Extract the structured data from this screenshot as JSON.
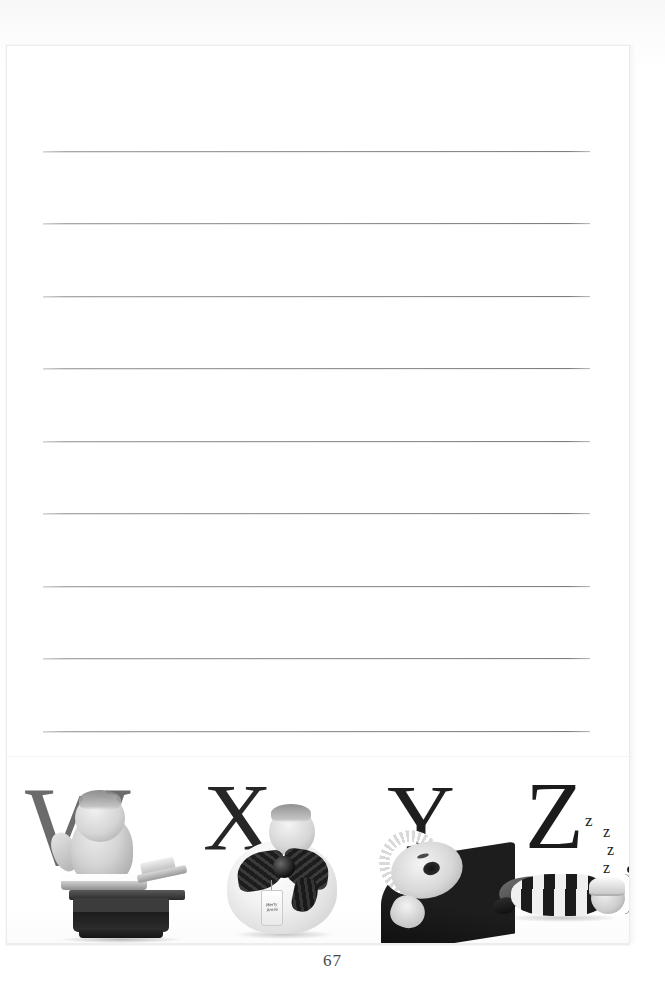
{
  "page": {
    "number": "67",
    "kind": "lined-journal-page",
    "line_count": 9,
    "background_color": "#ffffff",
    "border_color": "#ececec",
    "rule_color": "#8d8d8d"
  },
  "ruled_lines": [
    {
      "index": 1,
      "text": ""
    },
    {
      "index": 2,
      "text": ""
    },
    {
      "index": 3,
      "text": ""
    },
    {
      "index": 4,
      "text": ""
    },
    {
      "index": 5,
      "text": ""
    },
    {
      "index": 6,
      "text": ""
    },
    {
      "index": 7,
      "text": ""
    },
    {
      "index": 8,
      "text": ""
    },
    {
      "index": 9,
      "text": ""
    }
  ],
  "alphabet_strip": {
    "letters": [
      {
        "letter": "W",
        "color": "#6b6b6b",
        "photo_caption": "baby sitting on an old balance scale",
        "icon": "baby-on-scale-photo"
      },
      {
        "letter": "X",
        "color": "#262626",
        "photo_caption": "baby wrapped as a gift with a plaid bow and gift tag",
        "icon": "baby-gift-photo",
        "tag_text": "Merry Xmas"
      },
      {
        "letter": "Y",
        "color": "#1f1f1f",
        "photo_caption": "yawning baby in a ruffled bonnet",
        "icon": "yawning-baby-photo"
      },
      {
        "letter": "Z",
        "color": "#1b1b1b",
        "photo_caption": "sleeping baby in striped pyjamas and nightcap",
        "icon": "sleeping-baby-photo",
        "snore_marks": [
          "z",
          "z",
          "z",
          "z"
        ]
      }
    ]
  }
}
